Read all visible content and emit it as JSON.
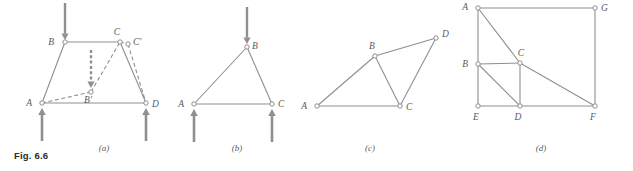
{
  "figure": {
    "caption": "Fig. 6.6",
    "stroke_color": "#8f8f8f",
    "label_color": "#5a5a5a",
    "node_fill": "#ffffff",
    "panels": [
      {
        "id": "a",
        "label": "(a)",
        "label_x": 104,
        "label_y": 151,
        "nodes": [
          {
            "name": "A",
            "x": 42,
            "y": 103,
            "label_dx": -10,
            "label_dy": 3
          },
          {
            "name": "B",
            "x": 65,
            "y": 42,
            "label_dx": -11,
            "label_dy": 3
          },
          {
            "name": "C",
            "x": 120,
            "y": 42,
            "label_dx": -3,
            "label_dy": -7
          },
          {
            "name": "D",
            "x": 146,
            "y": 103,
            "label_dx": 6,
            "label_dy": 4
          },
          {
            "name": "C'",
            "x": 128,
            "y": 44,
            "label_dx": 5,
            "label_dy": 1
          },
          {
            "name": "B'",
            "x": 91,
            "y": 92,
            "label_dx": -3,
            "label_dy": 11
          }
        ],
        "solid_edges": [
          [
            "A",
            "B"
          ],
          [
            "B",
            "C"
          ],
          [
            "C",
            "D"
          ],
          [
            "A",
            "D"
          ]
        ],
        "dashed_edges": [
          [
            "A",
            "B'"
          ],
          [
            "B'",
            "C"
          ],
          [
            "C'",
            "D"
          ],
          [
            "C",
            "C'"
          ]
        ],
        "load_arrows": [
          {
            "name": "load-at-B",
            "x": 65,
            "y1": 3,
            "y2": 40,
            "direction": "down",
            "style": "solid"
          },
          {
            "name": "displacement-at-B",
            "x": 91,
            "y1": 50,
            "y2": 88,
            "direction": "down",
            "style": "dashed"
          }
        ],
        "support_arrows": [
          {
            "name": "reaction-at-A",
            "x": 42,
            "y1": 141,
            "y2": 108,
            "direction": "up"
          },
          {
            "name": "reaction-at-D",
            "x": 146,
            "y1": 141,
            "y2": 108,
            "direction": "up"
          }
        ]
      },
      {
        "id": "b",
        "label": "(b)",
        "label_x": 237,
        "label_y": 151,
        "nodes": [
          {
            "name": "A",
            "x": 194,
            "y": 104,
            "label_dx": -10,
            "label_dy": 3
          },
          {
            "name": "B",
            "x": 247,
            "y": 47,
            "label_dx": 5,
            "label_dy": 2
          },
          {
            "name": "C",
            "x": 272,
            "y": 104,
            "label_dx": 6,
            "label_dy": 3
          }
        ],
        "solid_edges": [
          [
            "A",
            "B"
          ],
          [
            "B",
            "C"
          ],
          [
            "A",
            "C"
          ]
        ],
        "dashed_edges": [],
        "load_arrows": [
          {
            "name": "load-at-B",
            "x": 247,
            "y1": 7,
            "y2": 44,
            "direction": "down",
            "style": "solid"
          }
        ],
        "support_arrows": [
          {
            "name": "reaction-at-A",
            "x": 194,
            "y1": 142,
            "y2": 109,
            "direction": "up"
          },
          {
            "name": "reaction-at-C",
            "x": 272,
            "y1": 142,
            "y2": 109,
            "direction": "up"
          }
        ]
      },
      {
        "id": "c",
        "label": "(c)",
        "label_x": 370,
        "label_y": 151,
        "nodes": [
          {
            "name": "A",
            "x": 317,
            "y": 106,
            "label_dx": -10,
            "label_dy": 3
          },
          {
            "name": "B",
            "x": 375,
            "y": 56,
            "label_dx": -3,
            "label_dy": -7
          },
          {
            "name": "C",
            "x": 400,
            "y": 106,
            "label_dx": 6,
            "label_dy": 4
          },
          {
            "name": "D",
            "x": 436,
            "y": 38,
            "label_dx": 6,
            "label_dy": -1
          }
        ],
        "solid_edges": [
          [
            "A",
            "B"
          ],
          [
            "B",
            "D"
          ],
          [
            "B",
            "C"
          ],
          [
            "C",
            "D"
          ],
          [
            "A",
            "C"
          ]
        ],
        "dashed_edges": [],
        "load_arrows": [],
        "support_arrows": []
      },
      {
        "id": "d",
        "label": "(d)",
        "label_x": 541,
        "label_y": 151,
        "nodes": [
          {
            "name": "A",
            "x": 478,
            "y": 8,
            "label_dx": -10,
            "label_dy": 2
          },
          {
            "name": "G",
            "x": 595,
            "y": 8,
            "label_dx": 6,
            "label_dy": 3
          },
          {
            "name": "B",
            "x": 478,
            "y": 64,
            "label_dx": -10,
            "label_dy": 3
          },
          {
            "name": "C",
            "x": 520,
            "y": 63,
            "label_dx": 1,
            "label_dy": -7
          },
          {
            "name": "E",
            "x": 478,
            "y": 106,
            "label_dx": -2,
            "label_dy": 14
          },
          {
            "name": "D",
            "x": 520,
            "y": 106,
            "label_dx": -2,
            "label_dy": 14
          },
          {
            "name": "F",
            "x": 595,
            "y": 106,
            "label_dx": -2,
            "label_dy": 14
          }
        ],
        "solid_edges": [
          [
            "A",
            "G"
          ],
          [
            "A",
            "E"
          ],
          [
            "G",
            "F"
          ],
          [
            "E",
            "F"
          ],
          [
            "A",
            "C"
          ],
          [
            "C",
            "F"
          ],
          [
            "B",
            "C"
          ],
          [
            "C",
            "D"
          ],
          [
            "B",
            "D"
          ]
        ],
        "dashed_edges": [],
        "load_arrows": [],
        "support_arrows": []
      }
    ]
  }
}
